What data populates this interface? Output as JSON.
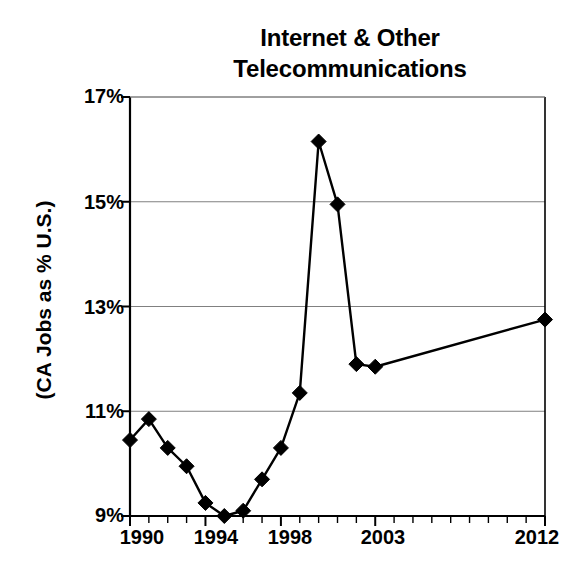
{
  "chart_data": {
    "type": "line",
    "title": "Internet & Other Telecommunications",
    "title_line1": "Internet & Other",
    "title_line2": "Telecommunications",
    "xlabel": "",
    "ylabel": "(CA Jobs as % U.S.)",
    "ylim": [
      9,
      17
    ],
    "xlim": [
      1990,
      2012
    ],
    "ytick_labels": [
      "9%",
      "11%",
      "13%",
      "15%",
      "17%"
    ],
    "ytick_values": [
      9,
      11,
      13,
      15,
      17
    ],
    "xtick_labels": [
      "1990",
      "1994",
      "1998",
      "2003",
      "2012"
    ],
    "xtick_values": [
      1990,
      1994,
      1998,
      2003,
      2012
    ],
    "minor_xticks": [
      1990,
      1991,
      1992,
      1993,
      1994,
      1995,
      1996,
      1997,
      1998,
      1999,
      2000,
      2001,
      2002,
      2003,
      2004,
      2005,
      2006,
      2007,
      2008,
      2009,
      2010,
      2011,
      2012
    ],
    "grid": "horizontal",
    "legend": "none",
    "marker": "diamond",
    "line_color": "#000000",
    "marker_color": "#000000",
    "grid_color": "#808080",
    "axis_color": "#000000",
    "x": [
      1990,
      1991,
      1992,
      1993,
      1994,
      1995,
      1996,
      1997,
      1998,
      1999,
      2000,
      2001,
      2002,
      2003,
      2012
    ],
    "values": [
      10.45,
      10.85,
      10.3,
      9.95,
      9.25,
      9.0,
      9.1,
      9.7,
      10.3,
      11.35,
      16.15,
      14.95,
      11.9,
      11.85,
      12.75
    ],
    "points": [
      {
        "x": 1990,
        "y": 10.45
      },
      {
        "x": 1991,
        "y": 10.85
      },
      {
        "x": 1992,
        "y": 10.3
      },
      {
        "x": 1993,
        "y": 9.95
      },
      {
        "x": 1994,
        "y": 9.25
      },
      {
        "x": 1995,
        "y": 9.0
      },
      {
        "x": 1996,
        "y": 9.1
      },
      {
        "x": 1997,
        "y": 9.7
      },
      {
        "x": 1998,
        "y": 10.3
      },
      {
        "x": 1999,
        "y": 11.35
      },
      {
        "x": 2000,
        "y": 16.15
      },
      {
        "x": 2001,
        "y": 14.95
      },
      {
        "x": 2002,
        "y": 11.9
      },
      {
        "x": 2003,
        "y": 11.85
      },
      {
        "x": 2012,
        "y": 12.75
      }
    ]
  }
}
